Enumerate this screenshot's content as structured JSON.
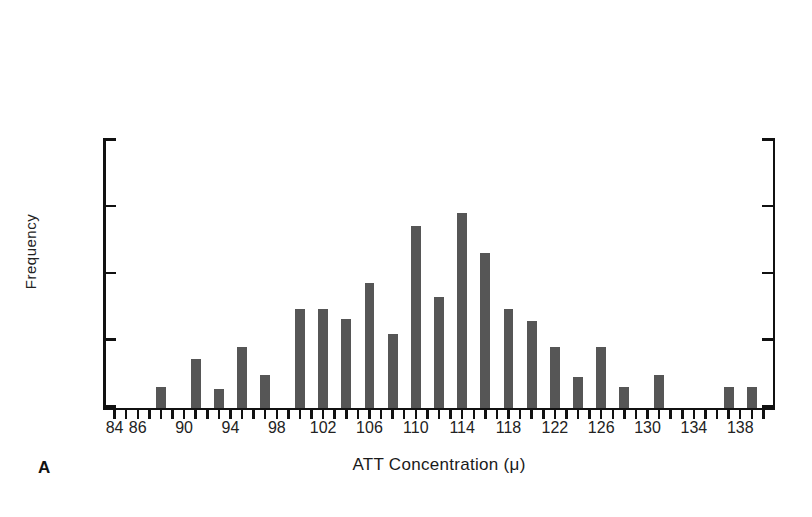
{
  "chart_data": {
    "type": "bar",
    "title": "",
    "subtitle": "",
    "xlabel": "ATT Concentration (μ)",
    "ylabel": "Frequency",
    "panel_label": "A",
    "xlim": [
      83,
      141
    ],
    "ylim": [
      0,
      20
    ],
    "grid": false,
    "legend": null,
    "y_ticks": [
      0,
      10,
      20
    ],
    "y_tick_labels": [
      "0",
      "10",
      "20"
    ],
    "y_minor_ticks": [
      5,
      15
    ],
    "x_tick_labels": [
      "84",
      "86",
      "90",
      "94",
      "98",
      "102",
      "106",
      "110",
      "114",
      "118",
      "122",
      "126",
      "130",
      "134",
      "138"
    ],
    "x_tick_values": [
      84,
      86,
      90,
      94,
      98,
      102,
      106,
      110,
      114,
      118,
      122,
      126,
      130,
      134,
      138
    ],
    "bar_color": "#565656",
    "axis_color": "#111111",
    "categories": [
      84,
      85,
      86,
      87,
      88,
      89,
      90,
      91,
      92,
      93,
      94,
      95,
      96,
      97,
      98,
      99,
      100,
      101,
      102,
      103,
      104,
      105,
      106,
      107,
      108,
      109,
      110,
      111,
      112,
      113,
      114,
      115,
      116,
      117,
      118,
      119,
      120,
      121,
      122,
      123,
      124,
      125,
      126,
      127,
      128,
      129,
      130,
      131,
      132,
      133,
      134,
      135,
      136,
      137,
      138,
      139,
      140
    ],
    "values": [
      0,
      0,
      0,
      0,
      1.5,
      0,
      0,
      3.6,
      1.4,
      0,
      4.5,
      0,
      2.4,
      0,
      7.4,
      7.4,
      6.6,
      9.3,
      5.5,
      13.6,
      8.3,
      14.6,
      11.6,
      7.4,
      6.5,
      4.5,
      2.3,
      4.5,
      1.5,
      0,
      2.4,
      0,
      0,
      1.5,
      1.5,
      0,
      0,
      0,
      0,
      0,
      0,
      0,
      0,
      0,
      0,
      0,
      0,
      0,
      0,
      0,
      0,
      0,
      0,
      0,
      0,
      0,
      0
    ],
    "bars": [
      {
        "x": 88,
        "value": 1.5
      },
      {
        "x": 91,
        "value": 3.6
      },
      {
        "x": 93,
        "value": 1.4
      },
      {
        "x": 95,
        "value": 4.5
      },
      {
        "x": 97,
        "value": 2.4
      },
      {
        "x": 100,
        "value": 7.4
      },
      {
        "x": 102,
        "value": 7.4
      },
      {
        "x": 104,
        "value": 6.6
      },
      {
        "x": 106,
        "value": 9.3
      },
      {
        "x": 108,
        "value": 5.5
      },
      {
        "x": 110,
        "value": 13.6
      },
      {
        "x": 112,
        "value": 8.3
      },
      {
        "x": 114,
        "value": 14.6
      },
      {
        "x": 116,
        "value": 11.6
      },
      {
        "x": 118,
        "value": 7.4
      },
      {
        "x": 120,
        "value": 6.5
      },
      {
        "x": 122,
        "value": 4.5
      },
      {
        "x": 124,
        "value": 2.3
      },
      {
        "x": 126,
        "value": 4.5
      },
      {
        "x": 128,
        "value": 1.5
      },
      {
        "x": 131,
        "value": 2.4
      },
      {
        "x": 137,
        "value": 1.5
      },
      {
        "x": 139,
        "value": 1.5
      }
    ]
  }
}
